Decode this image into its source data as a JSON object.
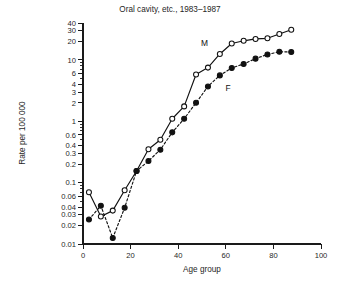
{
  "chart_data": {
    "type": "line",
    "title": "Oral cavity, etc., 1983–1987",
    "xlabel": "Age group",
    "ylabel": "Rate per 100 000",
    "yscale": "log",
    "xlim": [
      0,
      100
    ],
    "ylim": [
      0.01,
      40
    ],
    "grid": false,
    "legend_position": "inline-annotation",
    "xticks": [
      0,
      20,
      40,
      60,
      80,
      100
    ],
    "xtick_labels": [
      "0",
      "20",
      "40",
      "60",
      "80",
      "100"
    ],
    "yticks": [
      0.01,
      0.02,
      0.03,
      0.04,
      0.06,
      0.1,
      0.2,
      0.3,
      0.4,
      0.6,
      1,
      2,
      3,
      4,
      6,
      10,
      20,
      30,
      40
    ],
    "ytick_labels": [
      "0.01",
      "0.02",
      "0.03",
      "0.04",
      "0.06",
      "0.1",
      "0.2",
      "0.3",
      "0.4",
      "0.6",
      "1",
      "2",
      "3",
      "4",
      "6",
      "10",
      "20",
      "30",
      "40"
    ],
    "annotations": [
      {
        "text": "M",
        "x": 51,
        "y": 17.0
      },
      {
        "text": "F",
        "x": 61,
        "y": 3.1
      }
    ],
    "series": [
      {
        "name": "M",
        "marker": "open-circle",
        "linestyle": "solid",
        "color": "#111111",
        "x": [
          2.5,
          7.5,
          12.5,
          17.5,
          22.5,
          27.5,
          32.5,
          37.5,
          42.5,
          47.5,
          52.5,
          57.5,
          62.5,
          67.5,
          72.5,
          77.5,
          82.5,
          87.5
        ],
        "y": [
          0.07,
          0.028,
          0.035,
          0.075,
          0.155,
          0.35,
          0.5,
          1.1,
          1.75,
          5.8,
          7.5,
          12.5,
          18.5,
          20.5,
          22.0,
          22.5,
          26.5,
          31.0
        ]
      },
      {
        "name": "F",
        "marker": "filled-circle",
        "linestyle": "dashed",
        "color": "#111111",
        "x": [
          2.5,
          7.5,
          12.5,
          17.5,
          22.5,
          27.5,
          32.5,
          37.5,
          42.5,
          47.5,
          52.5,
          57.5,
          62.5,
          67.5,
          72.5,
          77.5,
          82.5,
          87.5
        ],
        "y": [
          0.025,
          0.042,
          0.0125,
          0.039,
          0.155,
          0.225,
          0.345,
          0.66,
          1.1,
          2.0,
          3.7,
          5.6,
          7.4,
          8.6,
          10.5,
          12.3,
          13.6,
          13.5
        ]
      }
    ]
  }
}
